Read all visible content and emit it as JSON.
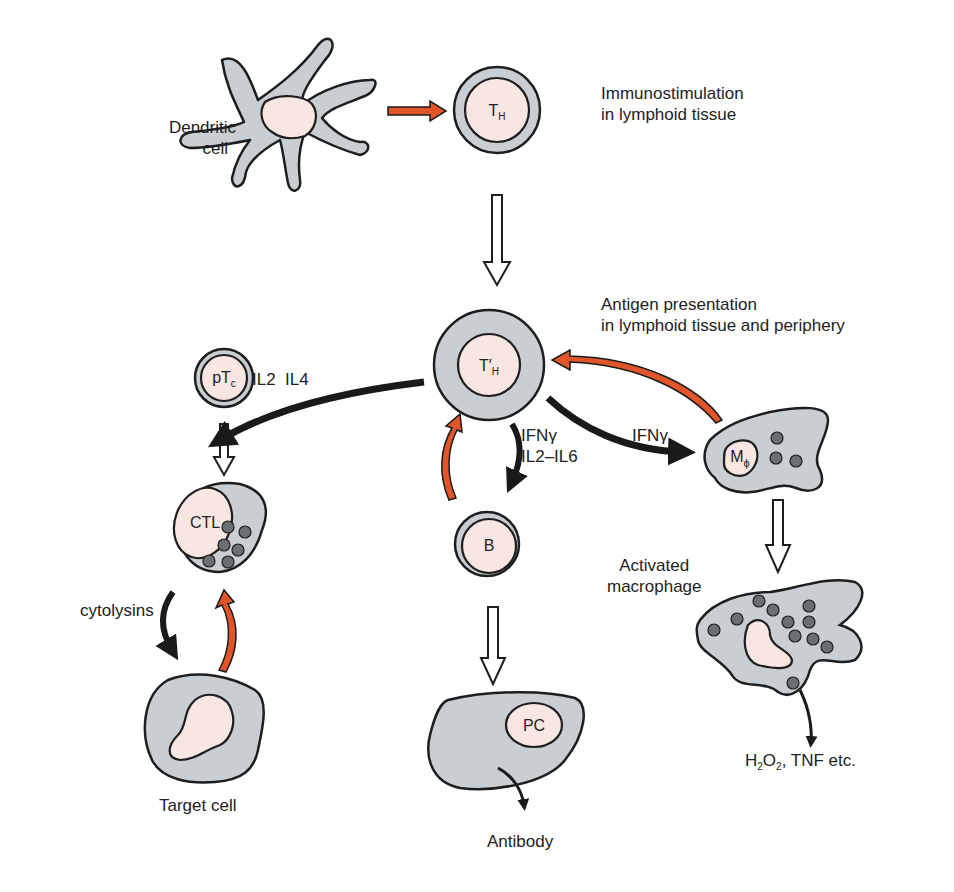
{
  "diagram": {
    "type": "immunology-cell-interaction",
    "colors": {
      "cytoplasm": "#c9ced2",
      "nucleus": "#f7e6e1",
      "outline": "#1e1e1e",
      "granule": "#6c6f72",
      "activating_arrow": "#e0552a",
      "effector_arrow": "#1a1a1a",
      "differentiation_arrow": "#ffffff"
    },
    "headings": {
      "immunostimulation": [
        "Immunostimulation",
        "in lymphoid tissue"
      ],
      "antigen_presentation": [
        "Antigen presentation",
        "in lymphoid tissue and periphery"
      ]
    },
    "nodes": {
      "dendritic": {
        "label_line1": "Dendritic",
        "label_line2": "cell"
      },
      "th": {
        "main": "T",
        "sub": "H"
      },
      "th_prime": {
        "main": "T′",
        "sub": "H"
      },
      "ptc": {
        "main": "pT",
        "sub": "c"
      },
      "ctl": {
        "label": "CTL"
      },
      "b": {
        "label": "B"
      },
      "pc": {
        "label": "PC"
      },
      "macrophage": {
        "main": "M",
        "sub": "ϕ"
      },
      "activated_macrophage": {
        "label_line1": "Activated",
        "label_line2": "macrophage"
      },
      "target": {
        "label": "Target cell"
      }
    },
    "edge_labels": {
      "th_to_ctl": "IL2  IL4",
      "th_to_b_1": "IFNγ",
      "th_to_b_2": "IL2–IL6",
      "th_to_mac": "IFNγ",
      "ctl_to_target": "cytolysins"
    },
    "outputs": {
      "antibody": "Antibody",
      "mac_products": {
        "h": "H",
        "sub1": "2",
        "o": "O",
        "sub2": "2",
        "rest": ", TNF etc."
      }
    }
  }
}
